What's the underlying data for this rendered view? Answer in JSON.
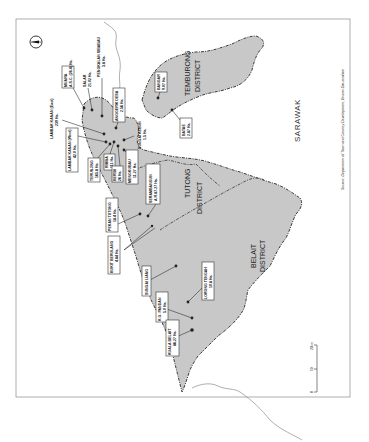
{
  "map": {
    "orientation": "rotated-90-ccw",
    "north_arrow": "north-arrow-icon",
    "region_label": "SARAWAK",
    "source": "Source: Department of Town and Country Development, Brunei Darussalam",
    "scale": {
      "ticks": [
        "0",
        "10",
        "20km"
      ]
    },
    "colors": {
      "land": "#c8c8c8",
      "sea": "#ffffff",
      "boundary": "#3a3a3a"
    },
    "districts": [
      {
        "name": "TEMBURONG",
        "suffix": "DISTRICT"
      },
      {
        "name": "TUTONG",
        "suffix": "DISTRICT"
      },
      {
        "name": "BELAIT",
        "suffix": "DISTRICT"
      }
    ],
    "sites": [
      {
        "name": "MUARA",
        "area": "A.S.C. (26.4) Ha."
      },
      {
        "name": "SALAR",
        "area": "21.02 Ha."
      },
      {
        "name": "PENGKALAN SIBABAU",
        "area": "3.8 Ha."
      },
      {
        "name": "ANGGERIK DESA",
        "area": "2.56 Ha."
      },
      {
        "name": "LAMBAK KANAN (East)",
        "area": "239 Ha."
      },
      {
        "name": "LAMBAK KANAN (West)",
        "area": "42.0 Ha."
      },
      {
        "name": "TERUNJING",
        "area": "165.8 Ha."
      },
      {
        "name": "RIMBA",
        "area": "111 Ha."
      },
      {
        "name": "BERIBI",
        "area": "26 Ha."
      },
      {
        "name": "SUNGAI KEBUN",
        "area": "1.5 Ha."
      },
      {
        "name": "MENGKUBAU",
        "area": "11.27 Ha."
      },
      {
        "name": "BANGAR",
        "area": "9.07 Ha."
      },
      {
        "name": "BATAE",
        "area": "2.87 Ha."
      },
      {
        "name": "PEKAN TUTONG",
        "area": "18.4 Ha."
      },
      {
        "name": "SERAMBANGUN",
        "area": "A.R.87.27 Ha."
      },
      {
        "name": "BUKIT BERULANG",
        "area": "4.84 Ha."
      },
      {
        "name": "SUNGAI LIANG",
        "area": ""
      },
      {
        "name": "LORONG TENGAH",
        "area": "10.8 Ha."
      },
      {
        "name": "K.G. PANDAN",
        "area": "5.0 Ha."
      },
      {
        "name": "KUALA BELAIT",
        "area": "86.27 Ha."
      }
    ]
  }
}
